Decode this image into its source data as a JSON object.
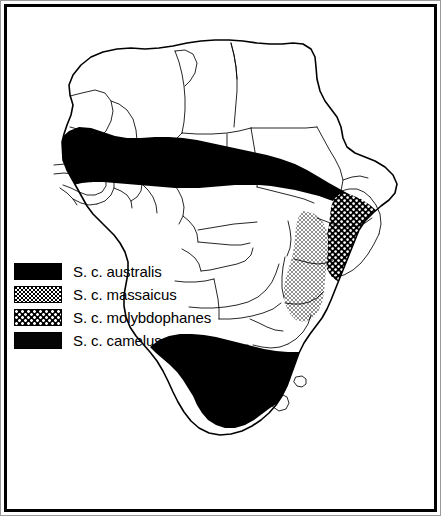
{
  "figure": {
    "kind": "distribution-map",
    "region": "Africa",
    "background_color": "#ffffff",
    "line_color": "#000000",
    "frame": {
      "outer_color": "#9a9a9a",
      "inner_color": "#000000"
    }
  },
  "legend": {
    "items": [
      {
        "label": "S. c. australis",
        "pattern": "solid-black",
        "swatch_class": "sw-solid",
        "fill": "#000000"
      },
      {
        "label": "S. c. massaicus",
        "pattern": "fine-stipple",
        "swatch_class": "sw-fine-stipple",
        "fill": "#ffffff"
      },
      {
        "label": "S. c. molybdophanes",
        "pattern": "white-dots-on-black",
        "swatch_class": "sw-white-dots",
        "fill": "#000000"
      },
      {
        "label": "S. c. camelus",
        "pattern": "dark-texture",
        "swatch_class": "sw-dark-texture",
        "fill": "#050505"
      }
    ]
  },
  "ranges": [
    {
      "name": "camelus-sahel-band",
      "subspecies": "S. c. camelus",
      "pattern": "solid-black"
    },
    {
      "name": "molybdophanes-horn",
      "subspecies": "S. c. molybdophanes",
      "pattern": "white-dots-on-black"
    },
    {
      "name": "massaicus-east-africa",
      "subspecies": "S. c. massaicus",
      "pattern": "fine-stipple"
    },
    {
      "name": "australis-southern-africa",
      "subspecies": "S. c. australis",
      "pattern": "solid-black"
    }
  ]
}
